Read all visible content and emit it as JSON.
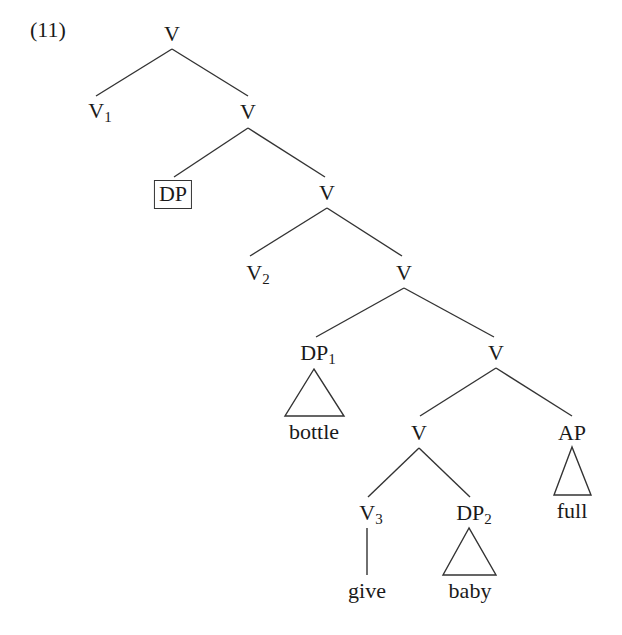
{
  "example": {
    "number": "(11)"
  },
  "tree": {
    "line_color": "#333333",
    "nodes": {
      "root": {
        "label": "V",
        "sub": ""
      },
      "v1": {
        "label": "V",
        "sub": "1"
      },
      "v_a": {
        "label": "V",
        "sub": ""
      },
      "dp_boxed": {
        "label": "DP",
        "sub": ""
      },
      "v_b": {
        "label": "V",
        "sub": ""
      },
      "v2": {
        "label": "V",
        "sub": "2"
      },
      "v_c": {
        "label": "V",
        "sub": ""
      },
      "dp1": {
        "label": "DP",
        "sub": "1"
      },
      "v_d": {
        "label": "V",
        "sub": ""
      },
      "v_e": {
        "label": "V",
        "sub": ""
      },
      "ap": {
        "label": "AP",
        "sub": ""
      },
      "v3": {
        "label": "V",
        "sub": "3"
      },
      "dp2": {
        "label": "DP",
        "sub": "2"
      }
    },
    "leaves": {
      "bottle": "bottle",
      "full": "full",
      "give": "give",
      "baby": "baby"
    }
  }
}
